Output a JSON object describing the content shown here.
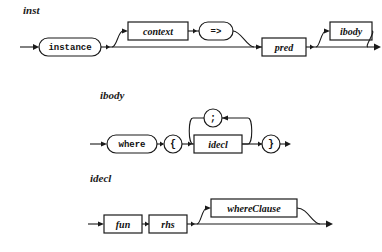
{
  "diagram": {
    "type": "railroad-syntax-diagram",
    "canvas": {
      "width": 382,
      "height": 252
    },
    "ink_color": "#1a1a1a",
    "background_color": "#ffffff",
    "rules": [
      {
        "id": "inst",
        "label": "inst",
        "label_pos": {
          "x": 23,
          "y": 12
        },
        "items": [
          {
            "name": "instance",
            "shape": "oval",
            "kind": "terminal"
          },
          {
            "name": "context",
            "shape": "box",
            "kind": "nonterminal",
            "optional": true
          },
          {
            "name": "=>",
            "shape": "oval",
            "kind": "terminal",
            "optional": true
          },
          {
            "name": "pred",
            "shape": "box",
            "kind": "nonterminal"
          },
          {
            "name": "ibody",
            "shape": "box",
            "kind": "nonterminal",
            "optional": true
          }
        ]
      },
      {
        "id": "ibody",
        "label": "ibody",
        "label_pos": {
          "x": 100,
          "y": 97
        },
        "items": [
          {
            "name": "where",
            "shape": "oval",
            "kind": "terminal"
          },
          {
            "name": "{",
            "shape": "circle",
            "kind": "terminal"
          },
          {
            "name": "idecl",
            "shape": "box",
            "kind": "nonterminal",
            "repeat_separator": ";"
          },
          {
            "name": ";",
            "shape": "circle",
            "kind": "terminal"
          },
          {
            "name": "}",
            "shape": "circle",
            "kind": "terminal"
          }
        ]
      },
      {
        "id": "idecl",
        "label": "idecl",
        "label_pos": {
          "x": 90,
          "y": 180
        },
        "items": [
          {
            "name": "fun",
            "shape": "box",
            "kind": "nonterminal"
          },
          {
            "name": "rhs",
            "shape": "box",
            "kind": "nonterminal"
          },
          {
            "name": "whereClause",
            "shape": "box",
            "kind": "nonterminal",
            "optional": true
          }
        ]
      }
    ],
    "nodes": {
      "instance": "instance",
      "context": "context",
      "arrow_fat": "=>",
      "pred": "pred",
      "ibody": "ibody",
      "where": "where",
      "lbrace": "{",
      "semicolon": ";",
      "idecl": "idecl",
      "rbrace": "}",
      "fun": "fun",
      "rhs": "rhs",
      "whereClause": "whereClause"
    }
  }
}
